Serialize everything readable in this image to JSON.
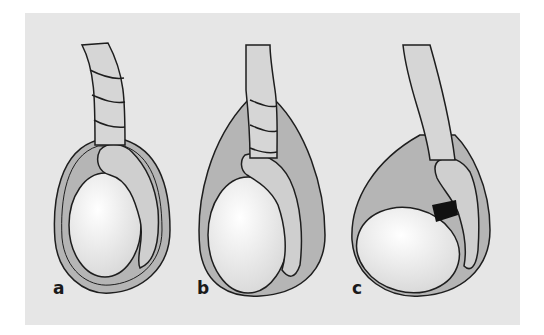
{
  "figure": {
    "panels": [
      {
        "label": "a",
        "description": "twisted spermatic cord above tunica vaginalis (extravaginal torsion)"
      },
      {
        "label": "b",
        "description": "twisted spermatic cord within tunica vaginalis (intravaginal torsion)"
      },
      {
        "label": "c",
        "description": "torsion between testis and epididymis (black band at mesorchium)"
      }
    ],
    "colors": {
      "background": "#e6e6e6",
      "tunica": "#b5b5b5",
      "cord": "#d6d6d6",
      "testis": "#f4f4f4",
      "outline": "#1e1e1e",
      "twist_band": "#111111"
    }
  }
}
